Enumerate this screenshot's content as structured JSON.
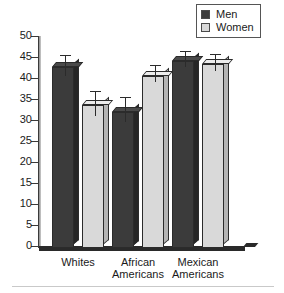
{
  "legend": {
    "position": "top-right",
    "entries": [
      {
        "label": "Men",
        "color": "#3b3b3b"
      },
      {
        "label": "Women",
        "color": "#d9d9d9"
      }
    ]
  },
  "axis": {
    "y_ticks": [
      "50",
      "45",
      "40",
      "35",
      "30",
      "25",
      "20",
      "15",
      "10",
      "5",
      "0"
    ]
  },
  "categories": [
    {
      "label": "Whites"
    },
    {
      "label": "African\nAmericans"
    },
    {
      "label": "Mexican\nAmericans"
    }
  ],
  "chart_data": {
    "type": "bar",
    "title": "",
    "xlabel": "",
    "ylabel": "",
    "ylim": [
      0,
      50
    ],
    "ytick_interval": 5,
    "grid": false,
    "legend_position": "top-right",
    "error_bars": true,
    "categories": [
      "Whites",
      "African Americans",
      "Mexican Americans"
    ],
    "series": [
      {
        "name": "Men",
        "color": "#3b3b3b",
        "values": [
          43,
          32.5,
          44.5
        ],
        "errors": [
          2.5,
          3,
          2
        ]
      },
      {
        "name": "Women",
        "color": "#d9d9d9",
        "values": [
          34,
          41,
          43.7
        ],
        "errors": [
          3,
          2,
          2
        ]
      }
    ]
  }
}
